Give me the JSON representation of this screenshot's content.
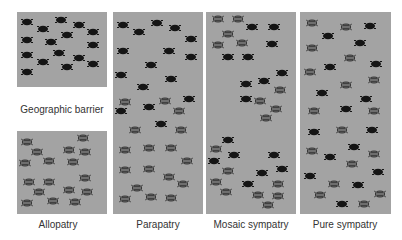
{
  "colors": {
    "panel_bg": "#a3a3a3",
    "black_insect": "#151515",
    "gray_insect": "#6e6e6e",
    "gray_insect_outline": "#2e2e2e",
    "barrier": "#ffffff",
    "caption_text": "#333333"
  },
  "barrier": {
    "label": "Geographic barrier",
    "panel": 0,
    "top": 75,
    "height": 44
  },
  "panels": [
    {
      "id": "allopatry",
      "caption": "Allopatry",
      "left": 17,
      "width": 90,
      "insects": {
        "black": [
          [
            10,
            10
          ],
          [
            26,
            17
          ],
          [
            44,
            8
          ],
          [
            62,
            13
          ],
          [
            76,
            20
          ],
          [
            50,
            23
          ],
          [
            10,
            28
          ],
          [
            34,
            30
          ],
          [
            76,
            33
          ],
          [
            10,
            43
          ],
          [
            42,
            41
          ],
          [
            62,
            46
          ],
          [
            26,
            50
          ],
          [
            50,
            55
          ],
          [
            76,
            52
          ],
          [
            10,
            60
          ]
        ],
        "gray": [
          [
            10,
            130
          ],
          [
            20,
            140
          ],
          [
            66,
            126
          ],
          [
            52,
            138
          ],
          [
            68,
            140
          ],
          [
            8,
            151
          ],
          [
            32,
            149
          ],
          [
            56,
            150
          ],
          [
            12,
            170
          ],
          [
            32,
            170
          ],
          [
            68,
            166
          ],
          [
            22,
            180
          ],
          [
            52,
            178
          ],
          [
            70,
            180
          ],
          [
            10,
            191
          ],
          [
            36,
            189
          ],
          [
            58,
            190
          ]
        ]
      }
    },
    {
      "id": "parapatry",
      "caption": "Parapatry",
      "left": 113,
      "width": 90,
      "insects": {
        "black": [
          [
            10,
            13
          ],
          [
            26,
            20
          ],
          [
            44,
            11
          ],
          [
            62,
            16
          ],
          [
            78,
            27
          ],
          [
            10,
            39
          ],
          [
            56,
            39
          ],
          [
            78,
            45
          ],
          [
            38,
            53
          ],
          [
            8,
            63
          ],
          [
            58,
            67
          ],
          [
            30,
            75
          ],
          [
            76,
            87
          ],
          [
            8,
            99
          ],
          [
            36,
            95
          ],
          [
            48,
            112
          ]
        ],
        "gray": [
          [
            12,
            90
          ],
          [
            52,
            89
          ],
          [
            66,
            99
          ],
          [
            22,
            118
          ],
          [
            68,
            118
          ],
          [
            12,
            138
          ],
          [
            36,
            136
          ],
          [
            58,
            136
          ],
          [
            74,
            149
          ],
          [
            12,
            158
          ],
          [
            36,
            157
          ],
          [
            56,
            165
          ],
          [
            70,
            172
          ],
          [
            24,
            176
          ],
          [
            38,
            185
          ],
          [
            12,
            187
          ],
          [
            58,
            186
          ]
        ]
      }
    },
    {
      "id": "mosaic-sympatry",
      "caption": "Mosaic sympatry",
      "left": 206,
      "width": 90,
      "insects": {
        "black": [
          [
            46,
            15
          ],
          [
            68,
            15
          ],
          [
            66,
            32
          ],
          [
            22,
            45
          ],
          [
            42,
            45
          ],
          [
            76,
            61
          ],
          [
            40,
            72
          ],
          [
            58,
            69
          ],
          [
            40,
            87
          ],
          [
            22,
            128
          ],
          [
            28,
            143
          ],
          [
            8,
            149
          ],
          [
            68,
            143
          ],
          [
            76,
            157
          ],
          [
            56,
            161
          ],
          [
            42,
            172
          ]
        ],
        "gray": [
          [
            12,
            7
          ],
          [
            32,
            7
          ],
          [
            22,
            22
          ],
          [
            12,
            33
          ],
          [
            36,
            31
          ],
          [
            74,
            78
          ],
          [
            54,
            89
          ],
          [
            70,
            97
          ],
          [
            60,
            106
          ],
          [
            10,
            137
          ],
          [
            22,
            159
          ],
          [
            10,
            170
          ],
          [
            20,
            180
          ],
          [
            52,
            183
          ],
          [
            72,
            172
          ],
          [
            72,
            184
          ],
          [
            62,
            193
          ]
        ]
      }
    },
    {
      "id": "pure-sympatry",
      "caption": "Pure sympatry",
      "left": 300,
      "width": 91,
      "insects": {
        "black": [
          [
            70,
            14
          ],
          [
            28,
            24
          ],
          [
            60,
            31
          ],
          [
            30,
            55
          ],
          [
            76,
            52
          ],
          [
            22,
            81
          ],
          [
            66,
            87
          ],
          [
            46,
            97
          ],
          [
            14,
            120
          ],
          [
            72,
            118
          ],
          [
            54,
            135
          ],
          [
            30,
            145
          ],
          [
            78,
            160
          ],
          [
            10,
            164
          ],
          [
            58,
            173
          ],
          [
            42,
            192
          ]
        ],
        "gray": [
          [
            12,
            11
          ],
          [
            46,
            15
          ],
          [
            12,
            36
          ],
          [
            50,
            46
          ],
          [
            10,
            60
          ],
          [
            46,
            73
          ],
          [
            74,
            68
          ],
          [
            14,
            99
          ],
          [
            74,
            99
          ],
          [
            42,
            118
          ],
          [
            12,
            139
          ],
          [
            74,
            142
          ],
          [
            52,
            152
          ],
          [
            34,
            172
          ],
          [
            20,
            183
          ],
          [
            80,
            182
          ],
          [
            64,
            192
          ]
        ]
      }
    }
  ]
}
